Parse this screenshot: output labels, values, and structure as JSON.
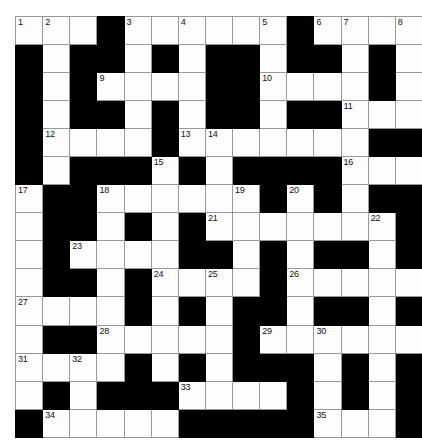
{
  "puzzle": {
    "type": "crossword-grid",
    "rows": 15,
    "columns": 15,
    "cell_colors": {
      "white": "#fdfdfd",
      "block": "#000000",
      "grid_line": "#9a9a9a",
      "border": "#4a4a4a",
      "number_text": "#111111"
    },
    "highest_clue_number": 35,
    "grid": [
      [
        {
          "block": false,
          "num": "1"
        },
        {
          "block": false,
          "num": "2"
        },
        {
          "block": false,
          "num": ""
        },
        {
          "block": true,
          "num": ""
        },
        {
          "block": false,
          "num": "3"
        },
        {
          "block": false,
          "num": ""
        },
        {
          "block": false,
          "num": "4"
        },
        {
          "block": false,
          "num": ""
        },
        {
          "block": false,
          "num": ""
        },
        {
          "block": false,
          "num": "5"
        },
        {
          "block": true,
          "num": ""
        },
        {
          "block": false,
          "num": "6"
        },
        {
          "block": false,
          "num": "7"
        },
        {
          "block": false,
          "num": ""
        },
        {
          "block": false,
          "num": "8"
        }
      ],
      [
        {
          "block": true,
          "num": ""
        },
        {
          "block": false,
          "num": ""
        },
        {
          "block": true,
          "num": ""
        },
        {
          "block": true,
          "num": ""
        },
        {
          "block": false,
          "num": ""
        },
        {
          "block": true,
          "num": ""
        },
        {
          "block": false,
          "num": ""
        },
        {
          "block": true,
          "num": ""
        },
        {
          "block": true,
          "num": ""
        },
        {
          "block": false,
          "num": ""
        },
        {
          "block": true,
          "num": ""
        },
        {
          "block": true,
          "num": ""
        },
        {
          "block": false,
          "num": ""
        },
        {
          "block": true,
          "num": ""
        },
        {
          "block": false,
          "num": ""
        }
      ],
      [
        {
          "block": true,
          "num": ""
        },
        {
          "block": false,
          "num": ""
        },
        {
          "block": true,
          "num": ""
        },
        {
          "block": false,
          "num": "9"
        },
        {
          "block": false,
          "num": ""
        },
        {
          "block": false,
          "num": ""
        },
        {
          "block": false,
          "num": ""
        },
        {
          "block": true,
          "num": ""
        },
        {
          "block": true,
          "num": ""
        },
        {
          "block": false,
          "num": "10"
        },
        {
          "block": false,
          "num": ""
        },
        {
          "block": false,
          "num": ""
        },
        {
          "block": false,
          "num": ""
        },
        {
          "block": true,
          "num": ""
        },
        {
          "block": false,
          "num": ""
        }
      ],
      [
        {
          "block": true,
          "num": ""
        },
        {
          "block": false,
          "num": ""
        },
        {
          "block": true,
          "num": ""
        },
        {
          "block": true,
          "num": ""
        },
        {
          "block": false,
          "num": ""
        },
        {
          "block": true,
          "num": ""
        },
        {
          "block": false,
          "num": ""
        },
        {
          "block": true,
          "num": ""
        },
        {
          "block": true,
          "num": ""
        },
        {
          "block": false,
          "num": ""
        },
        {
          "block": true,
          "num": ""
        },
        {
          "block": true,
          "num": ""
        },
        {
          "block": false,
          "num": "11"
        },
        {
          "block": false,
          "num": ""
        },
        {
          "block": false,
          "num": ""
        }
      ],
      [
        {
          "block": true,
          "num": ""
        },
        {
          "block": false,
          "num": "12"
        },
        {
          "block": false,
          "num": ""
        },
        {
          "block": false,
          "num": ""
        },
        {
          "block": false,
          "num": ""
        },
        {
          "block": true,
          "num": ""
        },
        {
          "block": false,
          "num": "13"
        },
        {
          "block": false,
          "num": "14"
        },
        {
          "block": false,
          "num": ""
        },
        {
          "block": false,
          "num": ""
        },
        {
          "block": false,
          "num": ""
        },
        {
          "block": false,
          "num": ""
        },
        {
          "block": false,
          "num": ""
        },
        {
          "block": true,
          "num": ""
        },
        {
          "block": true,
          "num": ""
        }
      ],
      [
        {
          "block": true,
          "num": ""
        },
        {
          "block": false,
          "num": ""
        },
        {
          "block": true,
          "num": ""
        },
        {
          "block": true,
          "num": ""
        },
        {
          "block": true,
          "num": ""
        },
        {
          "block": false,
          "num": "15"
        },
        {
          "block": true,
          "num": ""
        },
        {
          "block": false,
          "num": ""
        },
        {
          "block": true,
          "num": ""
        },
        {
          "block": true,
          "num": ""
        },
        {
          "block": true,
          "num": ""
        },
        {
          "block": true,
          "num": ""
        },
        {
          "block": false,
          "num": "16"
        },
        {
          "block": false,
          "num": ""
        },
        {
          "block": false,
          "num": ""
        }
      ],
      [
        {
          "block": false,
          "num": "17"
        },
        {
          "block": true,
          "num": ""
        },
        {
          "block": true,
          "num": ""
        },
        {
          "block": false,
          "num": "18"
        },
        {
          "block": false,
          "num": ""
        },
        {
          "block": false,
          "num": ""
        },
        {
          "block": false,
          "num": ""
        },
        {
          "block": false,
          "num": ""
        },
        {
          "block": false,
          "num": "19"
        },
        {
          "block": true,
          "num": ""
        },
        {
          "block": false,
          "num": "20"
        },
        {
          "block": true,
          "num": ""
        },
        {
          "block": false,
          "num": ""
        },
        {
          "block": true,
          "num": ""
        },
        {
          "block": true,
          "num": ""
        }
      ],
      [
        {
          "block": false,
          "num": ""
        },
        {
          "block": true,
          "num": ""
        },
        {
          "block": true,
          "num": ""
        },
        {
          "block": false,
          "num": ""
        },
        {
          "block": true,
          "num": ""
        },
        {
          "block": false,
          "num": ""
        },
        {
          "block": true,
          "num": ""
        },
        {
          "block": false,
          "num": "21"
        },
        {
          "block": false,
          "num": ""
        },
        {
          "block": false,
          "num": ""
        },
        {
          "block": false,
          "num": ""
        },
        {
          "block": false,
          "num": ""
        },
        {
          "block": false,
          "num": ""
        },
        {
          "block": false,
          "num": "22"
        },
        {
          "block": true,
          "num": ""
        }
      ],
      [
        {
          "block": false,
          "num": ""
        },
        {
          "block": true,
          "num": ""
        },
        {
          "block": false,
          "num": "23"
        },
        {
          "block": false,
          "num": ""
        },
        {
          "block": false,
          "num": ""
        },
        {
          "block": false,
          "num": ""
        },
        {
          "block": true,
          "num": ""
        },
        {
          "block": true,
          "num": ""
        },
        {
          "block": false,
          "num": ""
        },
        {
          "block": true,
          "num": ""
        },
        {
          "block": false,
          "num": ""
        },
        {
          "block": true,
          "num": ""
        },
        {
          "block": true,
          "num": ""
        },
        {
          "block": false,
          "num": ""
        },
        {
          "block": true,
          "num": ""
        }
      ],
      [
        {
          "block": false,
          "num": ""
        },
        {
          "block": true,
          "num": ""
        },
        {
          "block": true,
          "num": ""
        },
        {
          "block": false,
          "num": ""
        },
        {
          "block": true,
          "num": ""
        },
        {
          "block": false,
          "num": "24"
        },
        {
          "block": false,
          "num": ""
        },
        {
          "block": false,
          "num": "25"
        },
        {
          "block": false,
          "num": ""
        },
        {
          "block": true,
          "num": ""
        },
        {
          "block": false,
          "num": "26"
        },
        {
          "block": false,
          "num": ""
        },
        {
          "block": false,
          "num": ""
        },
        {
          "block": false,
          "num": ""
        },
        {
          "block": false,
          "num": ""
        }
      ],
      [
        {
          "block": false,
          "num": "27"
        },
        {
          "block": false,
          "num": ""
        },
        {
          "block": false,
          "num": ""
        },
        {
          "block": false,
          "num": ""
        },
        {
          "block": true,
          "num": ""
        },
        {
          "block": false,
          "num": ""
        },
        {
          "block": true,
          "num": ""
        },
        {
          "block": false,
          "num": ""
        },
        {
          "block": true,
          "num": ""
        },
        {
          "block": true,
          "num": ""
        },
        {
          "block": false,
          "num": ""
        },
        {
          "block": true,
          "num": ""
        },
        {
          "block": true,
          "num": ""
        },
        {
          "block": false,
          "num": ""
        },
        {
          "block": true,
          "num": ""
        }
      ],
      [
        {
          "block": false,
          "num": ""
        },
        {
          "block": true,
          "num": ""
        },
        {
          "block": true,
          "num": ""
        },
        {
          "block": false,
          "num": "28"
        },
        {
          "block": false,
          "num": ""
        },
        {
          "block": false,
          "num": ""
        },
        {
          "block": false,
          "num": ""
        },
        {
          "block": false,
          "num": ""
        },
        {
          "block": true,
          "num": ""
        },
        {
          "block": false,
          "num": "29"
        },
        {
          "block": false,
          "num": ""
        },
        {
          "block": false,
          "num": "30"
        },
        {
          "block": false,
          "num": ""
        },
        {
          "block": false,
          "num": ""
        },
        {
          "block": false,
          "num": ""
        }
      ],
      [
        {
          "block": false,
          "num": "31"
        },
        {
          "block": false,
          "num": ""
        },
        {
          "block": false,
          "num": "32"
        },
        {
          "block": false,
          "num": ""
        },
        {
          "block": true,
          "num": ""
        },
        {
          "block": false,
          "num": ""
        },
        {
          "block": true,
          "num": ""
        },
        {
          "block": false,
          "num": ""
        },
        {
          "block": true,
          "num": ""
        },
        {
          "block": true,
          "num": ""
        },
        {
          "block": true,
          "num": ""
        },
        {
          "block": false,
          "num": ""
        },
        {
          "block": true,
          "num": ""
        },
        {
          "block": false,
          "num": ""
        },
        {
          "block": true,
          "num": ""
        }
      ],
      [
        {
          "block": false,
          "num": ""
        },
        {
          "block": true,
          "num": ""
        },
        {
          "block": false,
          "num": ""
        },
        {
          "block": true,
          "num": ""
        },
        {
          "block": true,
          "num": ""
        },
        {
          "block": true,
          "num": ""
        },
        {
          "block": false,
          "num": "33"
        },
        {
          "block": false,
          "num": ""
        },
        {
          "block": false,
          "num": ""
        },
        {
          "block": false,
          "num": ""
        },
        {
          "block": true,
          "num": ""
        },
        {
          "block": false,
          "num": ""
        },
        {
          "block": true,
          "num": ""
        },
        {
          "block": false,
          "num": ""
        },
        {
          "block": true,
          "num": ""
        }
      ],
      [
        {
          "block": true,
          "num": ""
        },
        {
          "block": false,
          "num": "34"
        },
        {
          "block": false,
          "num": ""
        },
        {
          "block": false,
          "num": ""
        },
        {
          "block": false,
          "num": ""
        },
        {
          "block": false,
          "num": ""
        },
        {
          "block": true,
          "num": ""
        },
        {
          "block": true,
          "num": ""
        },
        {
          "block": true,
          "num": ""
        },
        {
          "block": true,
          "num": ""
        },
        {
          "block": true,
          "num": ""
        },
        {
          "block": false,
          "num": "35"
        },
        {
          "block": false,
          "num": ""
        },
        {
          "block": false,
          "num": ""
        },
        {
          "block": true,
          "num": ""
        }
      ]
    ]
  }
}
